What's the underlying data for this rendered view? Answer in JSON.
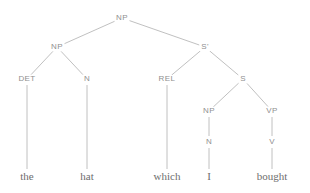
{
  "figure": {
    "kind": "constituency-syntax-tree",
    "sentence": "the hat which I bought",
    "background_color": "#ffffff",
    "line_color": "#b9b9b9",
    "node_text_color": "#8f8f8f",
    "terminal_text_color": "#6e6e6e",
    "width": 310,
    "height": 193
  },
  "nodes": [
    {
      "id": "np-root",
      "label": "NP",
      "x": 122,
      "y": 18,
      "kind": "nonterminal"
    },
    {
      "id": "np-left",
      "label": "NP",
      "x": 57,
      "y": 47,
      "kind": "nonterminal"
    },
    {
      "id": "sbar",
      "label": "S'",
      "x": 205,
      "y": 47,
      "kind": "nonterminal"
    },
    {
      "id": "det",
      "label": "DET",
      "x": 27,
      "y": 79,
      "kind": "nonterminal"
    },
    {
      "id": "n-hat",
      "label": "N",
      "x": 87,
      "y": 79,
      "kind": "nonterminal"
    },
    {
      "id": "rel",
      "label": "REL",
      "x": 167,
      "y": 79,
      "kind": "nonterminal"
    },
    {
      "id": "s",
      "label": "S",
      "x": 243,
      "y": 79,
      "kind": "nonterminal"
    },
    {
      "id": "np-sub",
      "label": "NP",
      "x": 209,
      "y": 111,
      "kind": "nonterminal"
    },
    {
      "id": "vp",
      "label": "VP",
      "x": 272,
      "y": 111,
      "kind": "nonterminal"
    },
    {
      "id": "n-i",
      "label": "N",
      "x": 209,
      "y": 142,
      "kind": "nonterminal"
    },
    {
      "id": "v",
      "label": "V",
      "x": 272,
      "y": 142,
      "kind": "nonterminal"
    },
    {
      "id": "w-the",
      "label": "the",
      "x": 27,
      "y": 176,
      "kind": "terminal"
    },
    {
      "id": "w-hat",
      "label": "hat",
      "x": 87,
      "y": 176,
      "kind": "terminal"
    },
    {
      "id": "w-which",
      "label": "which",
      "x": 167,
      "y": 176,
      "kind": "terminal"
    },
    {
      "id": "w-i",
      "label": "I",
      "x": 209,
      "y": 176,
      "kind": "terminal"
    },
    {
      "id": "w-bought",
      "label": "bought",
      "x": 272,
      "y": 176,
      "kind": "terminal"
    }
  ],
  "edges": [
    {
      "from": "np-root",
      "to": "np-left"
    },
    {
      "from": "np-root",
      "to": "sbar"
    },
    {
      "from": "np-left",
      "to": "det"
    },
    {
      "from": "np-left",
      "to": "n-hat"
    },
    {
      "from": "sbar",
      "to": "rel"
    },
    {
      "from": "sbar",
      "to": "s"
    },
    {
      "from": "s",
      "to": "np-sub"
    },
    {
      "from": "s",
      "to": "vp"
    },
    {
      "from": "np-sub",
      "to": "n-i"
    },
    {
      "from": "vp",
      "to": "v"
    },
    {
      "from": "det",
      "to": "w-the"
    },
    {
      "from": "n-hat",
      "to": "w-hat"
    },
    {
      "from": "rel",
      "to": "w-which"
    },
    {
      "from": "n-i",
      "to": "w-i"
    },
    {
      "from": "v",
      "to": "w-bought"
    }
  ]
}
